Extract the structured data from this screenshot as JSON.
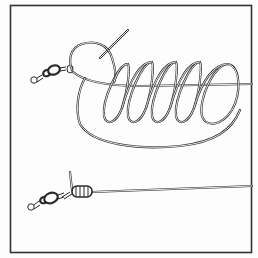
{
  "illustration": {
    "subject": "fishing knot tied to a barrel swivel",
    "panels": [
      {
        "name": "loose-coils",
        "description": "line passed through swivel eye and wrapped in open coils"
      },
      {
        "name": "tightened-knot",
        "description": "coils snugged down against swivel eye with tag end protruding"
      }
    ],
    "coil_count": 5,
    "colors": {
      "ink": "#2a2a2a",
      "paper": "#fdfdfd",
      "frame": "#333333"
    }
  }
}
